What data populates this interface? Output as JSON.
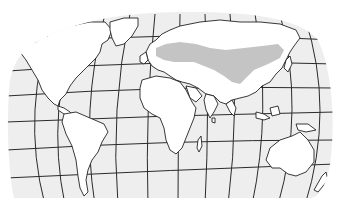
{
  "map": {
    "projection": "oval-world-graticule",
    "colors": {
      "background": "#ffffff",
      "ocean": "#eeeeee",
      "land": "#ffffff",
      "outline": "#222222",
      "highlighted_range": "#c4c4c4"
    },
    "highlighted_region": {
      "label": "",
      "extent": "Eastern Europe across Central Asia to the Russian Far East"
    },
    "continents": [
      "North America",
      "South America",
      "Europe",
      "Africa",
      "Asia",
      "Australia"
    ]
  }
}
